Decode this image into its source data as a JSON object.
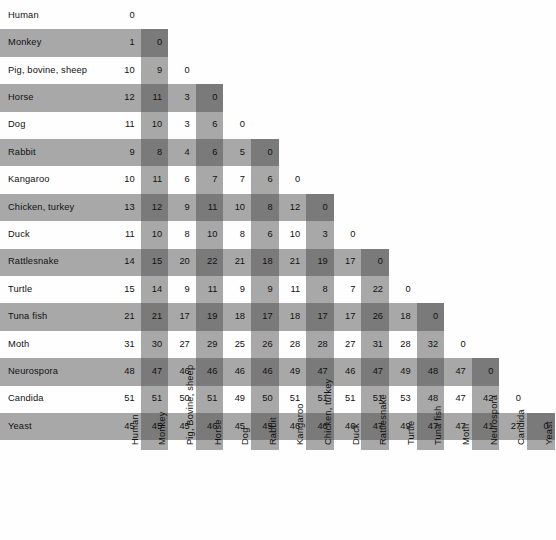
{
  "chart_data": {
    "type": "heatmap",
    "title": "",
    "subtitle": "",
    "xlabel": "",
    "ylabel": "",
    "grid": false,
    "legend": "none",
    "matrix_form": "lower-triangular",
    "diagonal_value": 0,
    "row_labels": [
      "Human",
      "Monkey",
      "Pig, bovine, sheep",
      "Horse",
      "Dog",
      "Rabbit",
      "Kangaroo",
      "Chicken, turkey",
      "Duck",
      "Rattlesnake",
      "Turtle",
      "Tuna  fish",
      "Moth",
      "Neurospora",
      "Candida",
      "Yeast"
    ],
    "column_labels": [
      "Human",
      "Monkey",
      "Pig, Bovine, sheep",
      "Horse",
      "Dog",
      "Rabbit",
      "Kangaroo",
      "Chicken, turkey",
      "Duck",
      "Rattlesnake",
      "Turtle",
      "Tuna fish",
      "Moth",
      "Neurospora",
      "Candida",
      "Yeast"
    ],
    "rows": [
      {
        "label": "Human",
        "values": [
          0
        ]
      },
      {
        "label": "Monkey",
        "values": [
          1,
          0
        ]
      },
      {
        "label": "Pig, bovine, sheep",
        "values": [
          10,
          9,
          0
        ]
      },
      {
        "label": "Horse",
        "values": [
          12,
          11,
          3,
          0
        ]
      },
      {
        "label": "Dog",
        "values": [
          11,
          10,
          3,
          6,
          0
        ]
      },
      {
        "label": "Rabbit",
        "values": [
          9,
          8,
          4,
          6,
          5,
          0
        ]
      },
      {
        "label": "Kangaroo",
        "values": [
          10,
          11,
          6,
          7,
          7,
          6,
          0
        ]
      },
      {
        "label": "Chicken, turkey",
        "values": [
          13,
          12,
          9,
          11,
          10,
          8,
          12,
          0
        ]
      },
      {
        "label": "Duck",
        "values": [
          11,
          10,
          8,
          10,
          8,
          6,
          10,
          3,
          0
        ]
      },
      {
        "label": "Rattlesnake",
        "values": [
          14,
          15,
          20,
          22,
          21,
          18,
          21,
          19,
          17,
          0
        ]
      },
      {
        "label": "Turtle",
        "values": [
          15,
          14,
          9,
          11,
          9,
          9,
          11,
          8,
          7,
          22,
          0
        ]
      },
      {
        "label": "Tuna  fish",
        "values": [
          21,
          21,
          17,
          19,
          18,
          17,
          18,
          17,
          17,
          26,
          18,
          0
        ]
      },
      {
        "label": "Moth",
        "values": [
          31,
          30,
          27,
          29,
          25,
          26,
          28,
          28,
          27,
          31,
          28,
          32,
          0
        ]
      },
      {
        "label": "Neurospora",
        "values": [
          48,
          47,
          46,
          46,
          46,
          46,
          49,
          47,
          46,
          47,
          49,
          48,
          47,
          0
        ]
      },
      {
        "label": "Candida",
        "values": [
          51,
          51,
          50,
          51,
          49,
          50,
          51,
          51,
          51,
          51,
          53,
          48,
          47,
          42,
          0
        ]
      },
      {
        "label": "Yeast",
        "values": [
          45,
          45,
          45,
          46,
          45,
          45,
          46,
          46,
          46,
          47,
          49,
          47,
          47,
          41,
          27,
          0
        ]
      }
    ]
  },
  "style": {
    "band_color": "#a8a8a8",
    "diagonal_block_color": "#7a7a7a",
    "background_color": "#ffffff",
    "text_color": "#111111"
  }
}
